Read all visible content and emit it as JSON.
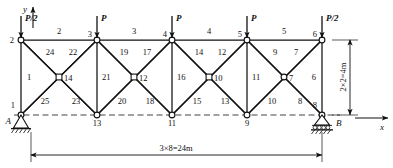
{
  "figure": {
    "type": "truss-structural-diagram",
    "axes": {
      "x_label": "x",
      "y_label": "y"
    },
    "supports": [
      {
        "id": "A",
        "label": "A",
        "node": "1",
        "kind": "pin",
        "x": 21,
        "y": 115
      },
      {
        "id": "B",
        "label": "B",
        "node": "8",
        "kind": "roller",
        "x": 322,
        "y": 115
      }
    ],
    "dimensions": {
      "horizontal": "3×8=24m",
      "vertical": "2×2=4m"
    },
    "loads": [
      {
        "label": "P/2",
        "at_node": "2",
        "x": 21,
        "y": 40
      },
      {
        "label": "P",
        "at_node": "3",
        "x": 97,
        "y": 40
      },
      {
        "label": "P",
        "at_node": "4",
        "x": 172,
        "y": 40
      },
      {
        "label": "P",
        "at_node": "5",
        "x": 247,
        "y": 40
      },
      {
        "label": "P/2",
        "at_node": "6",
        "x": 322,
        "y": 40
      }
    ],
    "nodes": [
      {
        "id": "1",
        "label": "1",
        "x": 21,
        "y": 115,
        "marker": "circle",
        "lx": 15,
        "ly": 108,
        "anchor": "end"
      },
      {
        "id": "2",
        "label": "2",
        "x": 21,
        "y": 40,
        "marker": "circle",
        "lx": 14,
        "ly": 43,
        "anchor": "end"
      },
      {
        "id": "3",
        "label": "3",
        "x": 97,
        "y": 40,
        "marker": "circle",
        "lx": 92,
        "ly": 37,
        "anchor": "end"
      },
      {
        "id": "4",
        "label": "4",
        "x": 172,
        "y": 40,
        "marker": "circle",
        "lx": 167,
        "ly": 37,
        "anchor": "end"
      },
      {
        "id": "5",
        "label": "5",
        "x": 247,
        "y": 40,
        "marker": "circle",
        "lx": 242,
        "ly": 37,
        "anchor": "end"
      },
      {
        "id": "6",
        "label": "6",
        "x": 322,
        "y": 40,
        "marker": "circle",
        "lx": 317,
        "ly": 37,
        "anchor": "end"
      },
      {
        "id": "7",
        "label": "7",
        "x": 284,
        "y": 77,
        "marker": "circle",
        "lx": 289,
        "ly": 81,
        "anchor": "start"
      },
      {
        "id": "8",
        "label": "8",
        "x": 322,
        "y": 115,
        "marker": "circle",
        "lx": 317,
        "ly": 108,
        "anchor": "end"
      },
      {
        "id": "9",
        "label": "9",
        "x": 247,
        "y": 115,
        "marker": "circle",
        "lx": 247,
        "ly": 126,
        "anchor": "middle"
      },
      {
        "id": "10",
        "label": "10",
        "x": 209,
        "y": 77,
        "marker": "square",
        "lx": 214,
        "ly": 81,
        "anchor": "start"
      },
      {
        "id": "11",
        "label": "11",
        "x": 172,
        "y": 115,
        "marker": "circle",
        "lx": 172,
        "ly": 126,
        "anchor": "middle"
      },
      {
        "id": "12",
        "label": "12",
        "x": 134,
        "y": 77,
        "marker": "square",
        "lx": 139,
        "ly": 81,
        "anchor": "start"
      },
      {
        "id": "13",
        "label": "13",
        "x": 97,
        "y": 115,
        "marker": "circle",
        "lx": 97,
        "ly": 126,
        "anchor": "middle"
      },
      {
        "id": "14",
        "label": "14",
        "x": 59,
        "y": 77,
        "marker": "square",
        "lx": 64,
        "ly": 81,
        "anchor": "start"
      }
    ],
    "members": [
      {
        "id": "2",
        "label": "2",
        "x1": 21,
        "y1": 40,
        "x2": 97,
        "y2": 40,
        "lx": 59,
        "ly": 34,
        "anchor": "middle"
      },
      {
        "id": "3",
        "label": "3",
        "x1": 97,
        "y1": 40,
        "x2": 172,
        "y2": 40,
        "lx": 134,
        "ly": 34,
        "anchor": "middle"
      },
      {
        "id": "4",
        "label": "4",
        "x1": 172,
        "y1": 40,
        "x2": 247,
        "y2": 40,
        "lx": 209,
        "ly": 34,
        "anchor": "middle"
      },
      {
        "id": "5",
        "label": "5",
        "x1": 247,
        "y1": 40,
        "x2": 322,
        "y2": 40,
        "lx": 284,
        "ly": 34,
        "anchor": "middle"
      },
      {
        "id": "1",
        "label": "1",
        "x1": 21,
        "y1": 40,
        "x2": 21,
        "y2": 115,
        "lx": 27,
        "ly": 80,
        "anchor": "start"
      },
      {
        "id": "21",
        "label": "21",
        "x1": 97,
        "y1": 40,
        "x2": 97,
        "y2": 115,
        "lx": 102,
        "ly": 80,
        "anchor": "start"
      },
      {
        "id": "16",
        "label": "16",
        "x1": 172,
        "y1": 40,
        "x2": 172,
        "y2": 115,
        "lx": 177,
        "ly": 80,
        "anchor": "start"
      },
      {
        "id": "11",
        "label": "11",
        "x1": 247,
        "y1": 40,
        "x2": 247,
        "y2": 115,
        "lx": 252,
        "ly": 80,
        "anchor": "start"
      },
      {
        "id": "6",
        "label": "6",
        "x1": 322,
        "y1": 40,
        "x2": 322,
        "y2": 115,
        "lx": 316,
        "ly": 80,
        "anchor": "end"
      },
      {
        "id": "24",
        "label": "24",
        "x1": 21,
        "y1": 40,
        "x2": 97,
        "y2": 115,
        "lx": 50,
        "ly": 55,
        "anchor": "middle"
      },
      {
        "id": "22",
        "label": "22",
        "x1": 97,
        "y1": 40,
        "x2": 21,
        "y2": 115,
        "lx": 73,
        "ly": 55,
        "anchor": "middle"
      },
      {
        "id": "25",
        "label": "25",
        "x1": 21,
        "y1": 115,
        "x2": 97,
        "y2": 40,
        "lx": 45,
        "ly": 104,
        "anchor": "middle"
      },
      {
        "id": "23",
        "label": "23",
        "x1": 97,
        "y1": 115,
        "x2": 21,
        "y2": 40,
        "lx": 76,
        "ly": 104,
        "anchor": "middle"
      },
      {
        "id": "19",
        "label": "19",
        "x1": 97,
        "y1": 40,
        "x2": 172,
        "y2": 115,
        "lx": 124,
        "ly": 55,
        "anchor": "middle"
      },
      {
        "id": "17",
        "label": "17",
        "x1": 172,
        "y1": 40,
        "x2": 97,
        "y2": 115,
        "lx": 147,
        "ly": 55,
        "anchor": "middle"
      },
      {
        "id": "20",
        "label": "20",
        "x1": 97,
        "y1": 115,
        "x2": 172,
        "y2": 40,
        "lx": 122,
        "ly": 104,
        "anchor": "middle"
      },
      {
        "id": "18",
        "label": "18",
        "x1": 172,
        "y1": 115,
        "x2": 97,
        "y2": 40,
        "lx": 150,
        "ly": 104,
        "anchor": "middle"
      },
      {
        "id": "14",
        "label": "14",
        "x1": 172,
        "y1": 40,
        "x2": 247,
        "y2": 115,
        "lx": 199,
        "ly": 55,
        "anchor": "middle"
      },
      {
        "id": "12",
        "label": "12",
        "x1": 247,
        "y1": 40,
        "x2": 172,
        "y2": 115,
        "lx": 222,
        "ly": 55,
        "anchor": "middle"
      },
      {
        "id": "15",
        "label": "15",
        "x1": 172,
        "y1": 115,
        "x2": 247,
        "y2": 40,
        "lx": 197,
        "ly": 104,
        "anchor": "middle"
      },
      {
        "id": "13",
        "label": "13",
        "x1": 247,
        "y1": 115,
        "x2": 172,
        "y2": 40,
        "lx": 225,
        "ly": 104,
        "anchor": "middle"
      },
      {
        "id": "9",
        "label": "9",
        "x1": 247,
        "y1": 40,
        "x2": 322,
        "y2": 115,
        "lx": 275,
        "ly": 55,
        "anchor": "middle"
      },
      {
        "id": "7",
        "label": "7",
        "x1": 322,
        "y1": 40,
        "x2": 247,
        "y2": 115,
        "lx": 296,
        "ly": 55,
        "anchor": "middle"
      },
      {
        "id": "10",
        "label": "10",
        "x1": 247,
        "y1": 115,
        "x2": 322,
        "y2": 40,
        "lx": 272,
        "ly": 104,
        "anchor": "middle"
      },
      {
        "id": "8",
        "label": "8",
        "x1": 322,
        "y1": 115,
        "x2": 247,
        "y2": 40,
        "lx": 300,
        "ly": 104,
        "anchor": "middle"
      }
    ]
  }
}
